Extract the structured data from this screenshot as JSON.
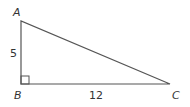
{
  "diagram": {
    "type": "right-triangle",
    "stroke_color": "#555555",
    "text_color": "#333333",
    "vertices": {
      "A": {
        "label": "A",
        "x": 21,
        "y": 21
      },
      "B": {
        "label": "B",
        "x": 21,
        "y": 84
      },
      "C": {
        "label": "C",
        "x": 170,
        "y": 84
      }
    },
    "sides": {
      "AB": {
        "label": "5"
      },
      "BC": {
        "label": "12"
      }
    },
    "right_angle_at": "B"
  }
}
